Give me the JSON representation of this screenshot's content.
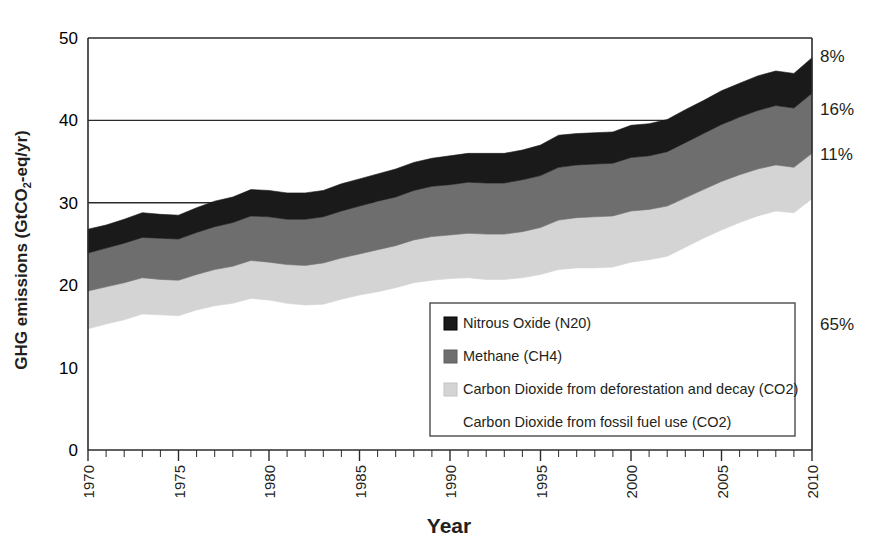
{
  "chart_data": {
    "type": "area",
    "stacked": true,
    "title": "",
    "xlabel": "Year",
    "ylabel": "GHG emissions (GtCO2-eq/yr)",
    "ylabel_parts": {
      "pre": "GHG emissions (GtCO",
      "sub": "2",
      "post": "-eq/yr)"
    },
    "xlim": [
      1970,
      2010
    ],
    "ylim": [
      0,
      50
    ],
    "yticks": [
      0,
      10,
      20,
      30,
      40,
      50
    ],
    "xticks": [
      1970,
      1975,
      1980,
      1985,
      1990,
      1995,
      2000,
      2005,
      2010
    ],
    "xtick_minor_step": 1,
    "grid": "horizontal-gridlines-at-30-40-50",
    "legend_position": "inside-lower-right",
    "x": [
      1970,
      1971,
      1972,
      1973,
      1974,
      1975,
      1976,
      1977,
      1978,
      1979,
      1980,
      1981,
      1982,
      1983,
      1984,
      1985,
      1986,
      1987,
      1988,
      1989,
      1990,
      1991,
      1992,
      1993,
      1994,
      1995,
      1996,
      1997,
      1998,
      1999,
      2000,
      2001,
      2002,
      2003,
      2004,
      2005,
      2006,
      2007,
      2008,
      2009,
      2010
    ],
    "series": [
      {
        "name": "Carbon Dioxide from fossil fuel use (CO2)",
        "color": "#ffffff",
        "swatch_border": "#ffffff",
        "share_pct": "65%",
        "values": [
          14.7,
          15.3,
          15.8,
          16.5,
          16.4,
          16.3,
          17.0,
          17.5,
          17.8,
          18.4,
          18.2,
          17.8,
          17.6,
          17.7,
          18.3,
          18.8,
          19.2,
          19.7,
          20.3,
          20.6,
          20.8,
          20.9,
          20.7,
          20.7,
          20.9,
          21.3,
          21.9,
          22.1,
          22.1,
          22.2,
          22.8,
          23.1,
          23.5,
          24.6,
          25.7,
          26.7,
          27.6,
          28.4,
          29.0,
          28.8,
          30.5
        ]
      },
      {
        "name": "Carbon Dioxide from deforestation and decay (CO2)",
        "color": "#d4d4d4",
        "swatch_border": "#c4c4c4",
        "share_pct": "11%",
        "values": [
          4.6,
          4.5,
          4.5,
          4.4,
          4.3,
          4.3,
          4.3,
          4.4,
          4.5,
          4.6,
          4.6,
          4.7,
          4.8,
          5.0,
          5.0,
          5.0,
          5.1,
          5.1,
          5.2,
          5.3,
          5.3,
          5.4,
          5.5,
          5.5,
          5.6,
          5.7,
          6.0,
          6.1,
          6.2,
          6.2,
          6.2,
          6.1,
          6.1,
          6.0,
          5.9,
          5.9,
          5.8,
          5.7,
          5.6,
          5.5,
          5.5
        ]
      },
      {
        "name": "Methane (CH4)",
        "color": "#6e6e6e",
        "swatch_border": "#5f5f5f",
        "share_pct": "16%",
        "values": [
          4.6,
          4.7,
          4.8,
          4.9,
          5.0,
          5.0,
          5.1,
          5.2,
          5.3,
          5.4,
          5.5,
          5.5,
          5.6,
          5.6,
          5.7,
          5.8,
          5.9,
          5.9,
          6.0,
          6.1,
          6.1,
          6.2,
          6.2,
          6.2,
          6.3,
          6.3,
          6.4,
          6.4,
          6.4,
          6.4,
          6.5,
          6.5,
          6.6,
          6.7,
          6.8,
          6.9,
          7.0,
          7.1,
          7.2,
          7.2,
          7.3
        ]
      },
      {
        "name": "Nitrous Oxide (N20)",
        "color": "#1a1a1a",
        "swatch_border": "#000000",
        "share_pct": "8%",
        "values": [
          2.9,
          2.8,
          2.9,
          3.0,
          2.9,
          2.9,
          3.0,
          3.1,
          3.1,
          3.2,
          3.2,
          3.2,
          3.2,
          3.2,
          3.3,
          3.3,
          3.3,
          3.4,
          3.4,
          3.4,
          3.5,
          3.5,
          3.6,
          3.6,
          3.6,
          3.7,
          3.9,
          3.8,
          3.8,
          3.8,
          3.9,
          3.9,
          3.9,
          4.0,
          4.0,
          4.1,
          4.1,
          4.2,
          4.2,
          4.2,
          4.3
        ]
      }
    ],
    "totals": [
      26.8,
      27.3,
      28.0,
      28.8,
      28.6,
      28.5,
      29.4,
      30.2,
      30.7,
      31.6,
      31.5,
      31.2,
      31.2,
      31.5,
      32.3,
      32.9,
      33.5,
      34.1,
      34.9,
      35.4,
      35.7,
      36.0,
      36.0,
      36.0,
      36.4,
      37.0,
      38.2,
      38.4,
      38.5,
      38.6,
      39.4,
      39.6,
      40.1,
      41.3,
      42.4,
      43.6,
      44.5,
      45.4,
      46.0,
      45.7,
      47.6
    ],
    "right_labels": [
      {
        "text": "8%",
        "series": "Nitrous Oxide (N20)"
      },
      {
        "text": "16%",
        "series": "Methane (CH4)"
      },
      {
        "text": "11%",
        "series": "Carbon Dioxide from deforestation and decay (CO2)"
      },
      {
        "text": "65%",
        "series": "Carbon Dioxide from fossil fuel use (CO2)"
      }
    ],
    "legend_entries": [
      {
        "label": "Nitrous Oxide (N20)",
        "color": "#1a1a1a"
      },
      {
        "label": "Methane (CH4)",
        "color": "#6e6e6e"
      },
      {
        "label": "Carbon Dioxide from deforestation and decay (CO2)",
        "color": "#d4d4d4"
      },
      {
        "label": "Carbon Dioxide from fossil fuel use (CO2)",
        "color": "#ffffff"
      }
    ]
  }
}
